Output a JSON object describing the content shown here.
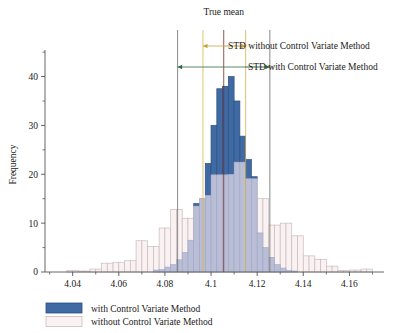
{
  "chart_data": {
    "type": "bar",
    "title": "True mean",
    "xlabel": "",
    "ylabel": "Frequency",
    "xlim": [
      4.028,
      4.175
    ],
    "ylim": [
      0,
      44
    ],
    "xticks": [
      "4.04",
      "4.06",
      "4.08",
      "4.1",
      "4.12",
      "4.14",
      "4.16"
    ],
    "xtick_values": [
      4.04,
      4.06,
      4.08,
      4.1,
      4.12,
      4.14,
      4.16
    ],
    "yticks": [
      "0",
      "10",
      "20",
      "30",
      "40"
    ],
    "ytick_values": [
      0,
      10,
      20,
      30,
      40
    ],
    "ytick_minor_values": [
      5,
      15,
      25,
      35
    ],
    "grid": false,
    "legend_position": "below-left",
    "bin_width": 0.0025,
    "bin_starts": [
      4.03,
      4.0325,
      4.035,
      4.0375,
      4.04,
      4.0425,
      4.045,
      4.0475,
      4.05,
      4.0525,
      4.055,
      4.0575,
      4.06,
      4.0625,
      4.065,
      4.0675,
      4.07,
      4.0725,
      4.075,
      4.0775,
      4.08,
      4.0825,
      4.085,
      4.0875,
      4.09,
      4.0925,
      4.095,
      4.0975,
      4.1,
      4.1025,
      4.105,
      4.1075,
      4.11,
      4.1125,
      4.115,
      4.1175,
      4.12,
      4.1225,
      4.125,
      4.1275,
      4.13,
      4.1325,
      4.135,
      4.1375,
      4.14,
      4.1425,
      4.145,
      4.1475,
      4.15,
      4.1525,
      4.155,
      4.1575,
      4.16,
      4.1625,
      4.165,
      4.1675
    ],
    "series": [
      {
        "name": "with Control Variate Method",
        "color": "#3f6aa4",
        "edge_color": "#2c4f80",
        "values": [
          0,
          0,
          0,
          0,
          0,
          0,
          0,
          0,
          0,
          0,
          0,
          0,
          0,
          0,
          0,
          0,
          0,
          0,
          0.4,
          0.5,
          1.0,
          1.5,
          2.5,
          4.0,
          6.5,
          14.0,
          15.0,
          22.2,
          30.0,
          37.5,
          38.0,
          40.0,
          35.0,
          27.8,
          23.0,
          19.5,
          8.0,
          5.0,
          3.0,
          1.5,
          0.8,
          0.3,
          0.2,
          0,
          0,
          0,
          0,
          0,
          0,
          0,
          0,
          0,
          0,
          0,
          0,
          0
        ]
      },
      {
        "name": "without Control Variate Method",
        "color": "#faf2f2",
        "edge_color": "#c8bcbc",
        "values": [
          0,
          0,
          0,
          0.3,
          0.3,
          0.2,
          0.2,
          0.6,
          0.6,
          1.8,
          1.8,
          2.0,
          2.0,
          2.3,
          2.3,
          6.4,
          6.4,
          5.2,
          5.2,
          9.0,
          9.0,
          12.8,
          12.8,
          11.0,
          11.0,
          13.5,
          15.0,
          15.7,
          19.9,
          19.9,
          19.9,
          20.0,
          22.5,
          22.5,
          19.1,
          19.1,
          15.0,
          15.0,
          9.6,
          9.6,
          10.0,
          10.0,
          7.4,
          7.4,
          3.3,
          3.3,
          2.6,
          2.6,
          1.2,
          1.2,
          0.3,
          0.3,
          0.4,
          0.4,
          0.6,
          0.6
        ]
      }
    ],
    "overlap_color": "#b9bed6",
    "vertical_lines": [
      {
        "name": "std-without-left",
        "x": 4.0855,
        "color": "#6b6b6b"
      },
      {
        "name": "std-with-left",
        "x": 4.0965,
        "color": "#d8b34a"
      },
      {
        "name": "true-mean",
        "x": 4.1055,
        "color": "#7a2a2a"
      },
      {
        "name": "std-with-right",
        "x": 4.115,
        "color": "#d8b34a"
      },
      {
        "name": "std-without-right",
        "x": 4.1255,
        "color": "#6b6b6b"
      }
    ],
    "annotations": [
      {
        "label": "STD without Control Variate Method",
        "color": "#c9a33c",
        "from_x": 4.0965,
        "to_x": 4.115
      },
      {
        "label": "STD with Control Variate Method",
        "color": "#2f6b3f",
        "from_x": 4.0855,
        "to_x": 4.1255
      }
    ]
  },
  "legend": {
    "items": [
      {
        "label": "with Control Variate Method",
        "color": "#3f6aa4",
        "edge_color": "#2c4f80"
      },
      {
        "label": "without Control Variate Method",
        "color": "#faf2f2",
        "edge_color": "#c8bcbc"
      }
    ]
  }
}
